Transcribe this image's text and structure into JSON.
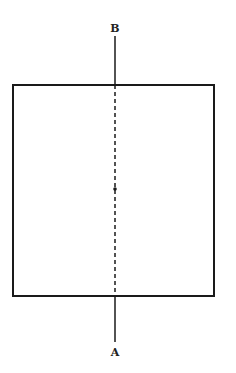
{
  "diagram": {
    "labels": {
      "top": "B",
      "bottom": "A"
    }
  }
}
